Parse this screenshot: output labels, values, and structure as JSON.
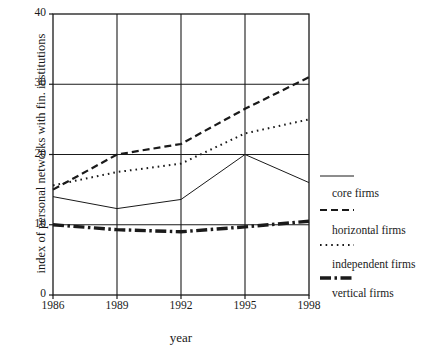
{
  "chart_data": {
    "type": "line",
    "title": "",
    "xlabel": "year",
    "ylabel": "index of personal networks with fin. institutions",
    "x": [
      1986,
      1989,
      1992,
      1995,
      1998
    ],
    "xtick_labels": [
      "1986",
      "1989",
      "1992",
      "1995",
      "1998"
    ],
    "ytick_labels": [
      "0",
      "10",
      "20",
      "30",
      "40"
    ],
    "ytick_values": [
      0,
      10,
      20,
      30,
      40
    ],
    "xlim": [
      1986,
      1998
    ],
    "ylim": [
      0,
      40
    ],
    "grid": true,
    "legend_position": "right",
    "series": [
      {
        "name": "core firms",
        "style": "solid-thin",
        "values": [
          14.0,
          12.3,
          13.6,
          20.0,
          16.0
        ]
      },
      {
        "name": "horizontal firms",
        "style": "dashed",
        "values": [
          15.0,
          20.0,
          21.5,
          26.5,
          31.0
        ]
      },
      {
        "name": "independent firms",
        "style": "dotted",
        "values": [
          15.6,
          17.5,
          18.7,
          23.0,
          25.0
        ]
      },
      {
        "name": "vertical firms",
        "style": "thick-dash-dot",
        "values": [
          10.0,
          9.3,
          9.0,
          9.7,
          10.5
        ]
      }
    ]
  },
  "legend": {
    "items": [
      {
        "label": "core firms",
        "style": "solid-thin"
      },
      {
        "label": "horizontal firms",
        "style": "dashed"
      },
      {
        "label": "independent firms",
        "style": "dotted"
      },
      {
        "label": "vertical firms",
        "style": "thick-dash-dot"
      }
    ]
  },
  "colors": {
    "axis": "#1a1a1a",
    "series": "#1a1a1a",
    "background": "#ffffff"
  }
}
